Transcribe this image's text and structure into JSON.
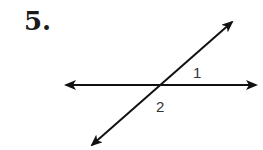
{
  "problem": {
    "number_label": "5."
  },
  "diagram": {
    "type": "intersecting-lines",
    "line_color": "#111111",
    "horizontal_line": {
      "x1": 66,
      "y1": 85,
      "x2": 256,
      "y2": 85
    },
    "transversal_line": {
      "x1": 92,
      "y1": 145,
      "x2": 232,
      "y2": 22
    },
    "intersection": {
      "x": 161,
      "y": 85
    },
    "angle_labels": [
      {
        "text": "1",
        "x": 193,
        "y": 78
      },
      {
        "text": "2",
        "x": 156,
        "y": 112
      }
    ]
  }
}
